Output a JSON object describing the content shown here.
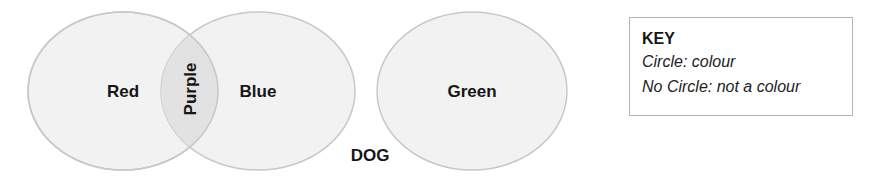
{
  "diagram": {
    "type": "venn",
    "circles": [
      {
        "id": "red",
        "label": "Red",
        "cx": 123,
        "cy": 91,
        "rx": 95,
        "ry": 79
      },
      {
        "id": "blue",
        "label": "Blue",
        "cx": 258,
        "cy": 91,
        "rx": 97,
        "ry": 79
      },
      {
        "id": "green",
        "label": "Green",
        "cx": 472,
        "cy": 91,
        "rx": 95,
        "ry": 79
      }
    ],
    "intersection": {
      "between": [
        "red",
        "blue"
      ],
      "label": "Purple",
      "orientation": "vertical"
    },
    "outside_items": [
      {
        "label": "DOG"
      }
    ],
    "colors": {
      "circle_fill": "#f2f2f2",
      "circle_stroke": "#c8c8c8",
      "intersection_fill": "#e2e2e2",
      "text": "#161616",
      "key_border": "#b4b4b4"
    }
  },
  "labels": {
    "red": "Red",
    "blue": "Blue",
    "green": "Green",
    "purple": "Purple",
    "dog": "DOG"
  },
  "key": {
    "title": "KEY",
    "lines": [
      "Circle: colour",
      "No Circle: not a colour"
    ]
  }
}
